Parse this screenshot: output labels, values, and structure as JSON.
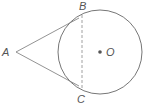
{
  "diagram": {
    "type": "geometry-tangent-lines",
    "colors": {
      "stroke": "#666666",
      "dashed": "#888888",
      "center_dot": "#555555",
      "label": "#555555"
    },
    "circle": {
      "cx": 100,
      "cy": 52,
      "r": 42,
      "center_label": "O"
    },
    "points": {
      "A": {
        "label": "A",
        "x": 16,
        "y": 52
      },
      "B": {
        "label": "B",
        "x": 82,
        "y": 14
      },
      "C": {
        "label": "C",
        "x": 82,
        "y": 90
      }
    },
    "segments": [
      {
        "from": "A",
        "to": "B",
        "style": "solid"
      },
      {
        "from": "A",
        "to": "C",
        "style": "solid"
      },
      {
        "from": "B",
        "to": "C",
        "style": "dashed"
      }
    ]
  }
}
